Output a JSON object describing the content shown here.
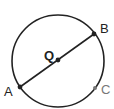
{
  "diagram": {
    "center": {
      "label": "Q"
    },
    "points": [
      {
        "id": "A",
        "label": "A",
        "on": "circle",
        "endpoint_of": "diameter"
      },
      {
        "id": "B",
        "label": "B",
        "on": "circle",
        "endpoint_of": "diameter"
      },
      {
        "id": "C",
        "label": "C",
        "on": "circle"
      }
    ],
    "segments": [
      {
        "from": "A",
        "to": "B",
        "through": "Q",
        "type": "diameter"
      }
    ],
    "colors": {
      "stroke": "#222222",
      "point_c": "#777777"
    }
  }
}
